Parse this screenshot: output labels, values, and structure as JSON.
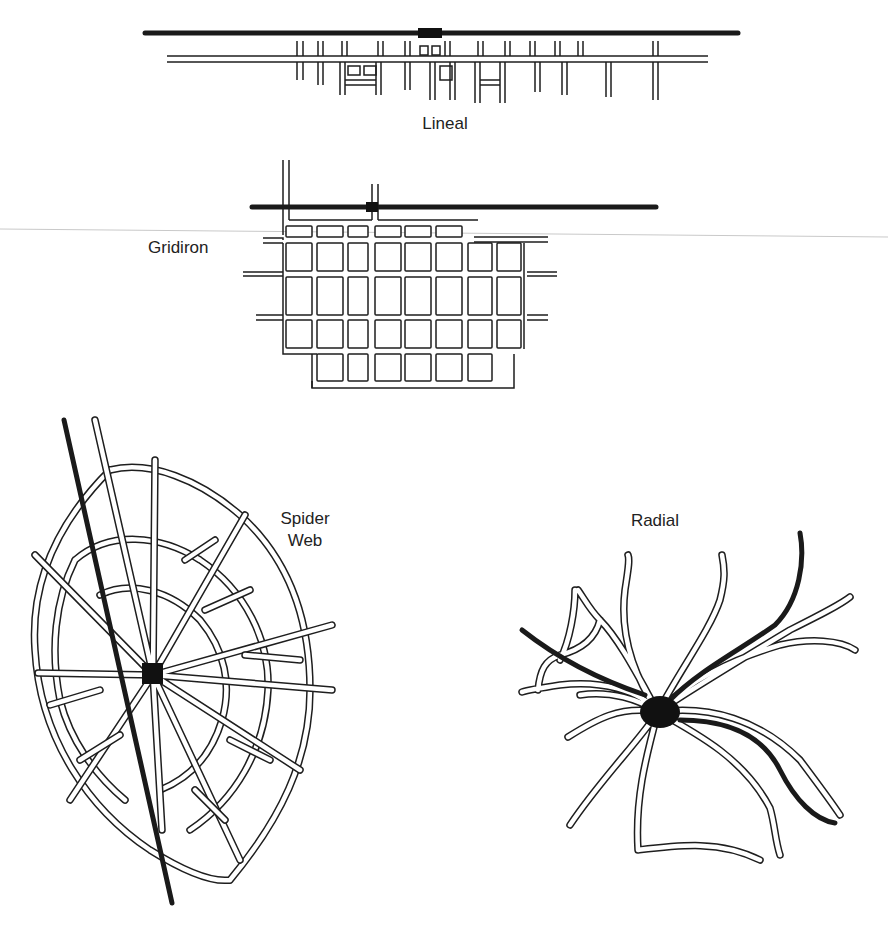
{
  "figure": {
    "colors": {
      "background": "#ffffff",
      "ink": "#1e1e1e",
      "rail": "#1a1a1a",
      "scan_line": "#c9c9c9"
    },
    "panels": [
      {
        "id": "lineal",
        "label": "Lineal"
      },
      {
        "id": "gridiron",
        "label": "Gridiron"
      },
      {
        "id": "spider-web",
        "label_line1": "Spider",
        "label_line2": "Web"
      },
      {
        "id": "radial",
        "label": "Radial"
      }
    ]
  },
  "legend_semantics": {
    "thick_black_line": "railroad / main transport line",
    "black_square": "central business node",
    "double_line": "street"
  }
}
